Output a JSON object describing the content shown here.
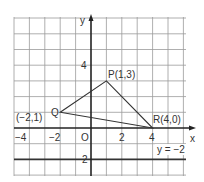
{
  "diagram": {
    "axes": {
      "x_label": "x",
      "y_label": "y",
      "origin_label": "O"
    },
    "x_ticks": [
      {
        "value": -4,
        "label": "−4"
      },
      {
        "value": -2,
        "label": "−2"
      },
      {
        "value": 2,
        "label": "2"
      },
      {
        "value": 4,
        "label": "4"
      }
    ],
    "y_ticks": [
      {
        "value": 4,
        "label": "4"
      },
      {
        "value": -2,
        "label": "2"
      }
    ],
    "points": {
      "P": {
        "label": "P(1,3)",
        "x": 1,
        "y": 3
      },
      "Q": {
        "label": "Q",
        "coord_label": "(−2,1)",
        "x": -2,
        "y": 1
      },
      "R": {
        "label": "R(4,0)",
        "x": 4,
        "y": 0
      }
    },
    "line": {
      "label": "y = −2",
      "y": -2
    },
    "colors": {
      "grid": "#8a8a8a",
      "axis": "#222222",
      "line": "#333333"
    }
  }
}
